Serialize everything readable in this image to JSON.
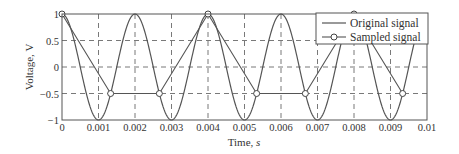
{
  "chart_data": {
    "type": "line",
    "title": "",
    "xlabel": "Time, s",
    "ylabel": "Voltage, V",
    "xlim": [
      0,
      0.01
    ],
    "ylim": [
      -1,
      1
    ],
    "grid": true,
    "legend_position": "upper right",
    "xticks": [
      "0",
      "0.001",
      "0.002",
      "0.003",
      "0.004",
      "0.005",
      "0.006",
      "0.007",
      "0.008",
      "0.009",
      "0.01"
    ],
    "yticks": [
      "−1",
      "−0.5",
      "0",
      "0.5",
      "1"
    ],
    "series": [
      {
        "name": "Original signal",
        "style": "line",
        "function": "cos(2*pi*500*t)",
        "frequency_hz": 500,
        "x": [
          0,
          0.0005,
          0.001,
          0.0015,
          0.002,
          0.0025,
          0.003,
          0.0035,
          0.004,
          0.0045,
          0.005,
          0.0055,
          0.006,
          0.0065,
          0.007,
          0.0075,
          0.008,
          0.0085,
          0.009,
          0.0095,
          0.01
        ],
        "values": [
          1,
          0,
          -1,
          0,
          1,
          0,
          -1,
          0,
          1,
          0,
          -1,
          0,
          1,
          0,
          -1,
          0,
          1,
          0,
          -1,
          0,
          1
        ]
      },
      {
        "name": "Sampled signal",
        "style": "line-circle-markers",
        "x": [
          0,
          0.001333,
          0.002667,
          0.004,
          0.005333,
          0.006667,
          0.008,
          0.009333
        ],
        "values": [
          1,
          -0.5,
          -0.5,
          1,
          -0.5,
          -0.5,
          1,
          -0.5
        ]
      }
    ]
  },
  "legend": {
    "items": [
      "Original signal",
      "Sampled signal"
    ]
  },
  "axes": {
    "xlabel_text": "Time, ",
    "xlabel_unit": "s",
    "ylabel_text": "Voltage, V"
  }
}
